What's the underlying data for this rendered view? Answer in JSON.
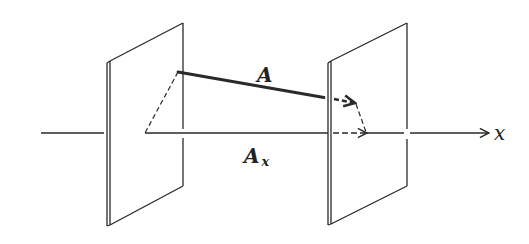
{
  "diagram": {
    "colors": {
      "line": "#2a2a2a",
      "background": "#ffffff"
    },
    "labels": {
      "vector": "A",
      "component": "A",
      "component_subscript": "x",
      "axis": "x"
    },
    "elements": {
      "planes": [
        "left-plane",
        "right-plane"
      ],
      "vector_A": "solid thick arrow from left plane to right plane (tip dashed behind plane)",
      "projection_lines": "dashed lines from vector endpoints perpendicular to x-axis",
      "component_A_x": "segment along x-axis between projection feet, dashed arrowhead"
    }
  }
}
